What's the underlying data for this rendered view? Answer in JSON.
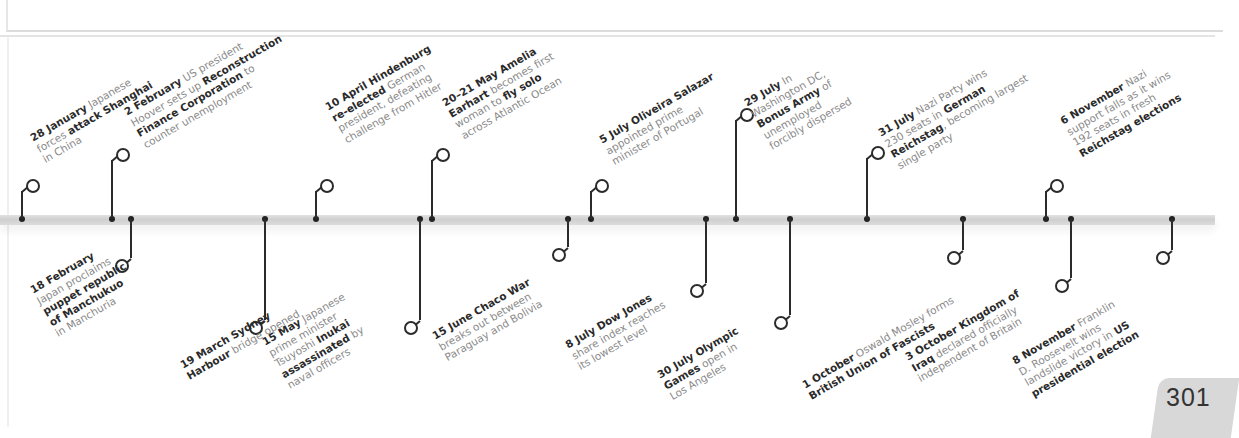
{
  "page": {
    "number": "301"
  },
  "timeline": {
    "year": "1932",
    "events_above": [
      {
        "date": "28 January",
        "lines": [
          [
            "28 January",
            " Japanese"
          ],
          [
            "forces ",
            "attack Shanghai"
          ],
          [
            "in China"
          ]
        ]
      },
      {
        "date": "2 February",
        "lines": [
          [
            "2 February",
            " US president"
          ],
          [
            "Hoover sets up ",
            "Reconstruction"
          ],
          [
            "Finance Corporation",
            " to"
          ],
          [
            "counter unemployment"
          ]
        ]
      },
      {
        "date": "10 April",
        "lines": [
          [
            "10 April Hindenburg"
          ],
          [
            "re-elected",
            " German"
          ],
          [
            "president, defeating"
          ],
          [
            "challenge from Hitler"
          ]
        ]
      },
      {
        "date": "20–21 May",
        "lines": [
          [
            "20–21 May Amelia"
          ],
          [
            "Earhart",
            " becomes first"
          ],
          [
            "woman to ",
            "fly solo"
          ],
          [
            "across Atlantic Ocean"
          ]
        ]
      },
      {
        "date": "5 July",
        "lines": [
          [
            "5 July Oliveira Salazar"
          ],
          [
            "appointed prime"
          ],
          [
            "minister of Portugal"
          ]
        ]
      },
      {
        "date": "29 July",
        "lines": [
          [
            "29 July",
            " In"
          ],
          [
            "Washington DC,"
          ],
          [
            "Bonus Army",
            " of"
          ],
          [
            "unemployed"
          ],
          [
            "forcibly dispersed"
          ]
        ]
      },
      {
        "date": "31 July",
        "lines": [
          [
            "31 July",
            " Nazi Party wins"
          ],
          [
            "230 seats in ",
            "German"
          ],
          [
            "Reichstag",
            ", becoming largest"
          ],
          [
            "single party"
          ]
        ]
      },
      {
        "date": "6 November",
        "lines": [
          [
            "6 November",
            " Nazi"
          ],
          [
            "support falls as it wins"
          ],
          [
            "192 seats in fresh"
          ],
          [
            "Reichstag elections"
          ]
        ]
      }
    ],
    "events_below": [
      {
        "date": "18 February",
        "lines": [
          [
            "18 February"
          ],
          [
            "Japan proclaims"
          ],
          [
            "puppet republic"
          ],
          [
            "of Manchukuo"
          ],
          [
            "in Manchuria"
          ]
        ]
      },
      {
        "date": "19 March",
        "lines": [
          [
            "19 March Sydney"
          ],
          [
            "Harbour",
            " bridge opened"
          ]
        ]
      },
      {
        "date": "15 May",
        "lines": [
          [
            "15 May",
            " Japanese"
          ],
          [
            "prime minister"
          ],
          [
            "Tsuyoshi ",
            "Inukai"
          ],
          [
            "assassinated",
            " by"
          ],
          [
            "naval officers"
          ]
        ]
      },
      {
        "date": "15 June",
        "lines": [
          [
            "15 June Chaco War"
          ],
          [
            "breaks out between"
          ],
          [
            "Paraguay and Bolivia"
          ]
        ]
      },
      {
        "date": "8 July",
        "lines": [
          [
            "8 July Dow Jones"
          ],
          [
            "share index reaches"
          ],
          [
            "its lowest level"
          ]
        ]
      },
      {
        "date": "30 July",
        "lines": [
          [
            "30 July Olympic"
          ],
          [
            "Games",
            " open in"
          ],
          [
            "Los Angeles"
          ]
        ]
      },
      {
        "date": "1 October",
        "lines": [
          [
            "1 October",
            " Oswald Mosley forms"
          ],
          [
            "British Union of Fascists"
          ]
        ]
      },
      {
        "date": "3 October",
        "lines": [
          [
            "3 October Kingdom of"
          ],
          [
            "Iraq",
            " declared officially"
          ],
          [
            "independent of Britain"
          ]
        ]
      },
      {
        "date": "8 November",
        "lines": [
          [
            "8 November",
            " Franklin"
          ],
          [
            "D. Roosevelt wins"
          ],
          [
            "landslide victory in ",
            "US"
          ],
          [
            "presidential election"
          ]
        ]
      }
    ]
  }
}
